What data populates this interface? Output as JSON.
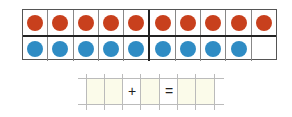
{
  "ten_frame": {
    "columns": 10,
    "top_row": {
      "count": 10,
      "color": "#c8401d"
    },
    "bottom_row": {
      "count": 9,
      "color": "#2f8cc4"
    }
  },
  "equation": {
    "cells": [
      "",
      "",
      "+",
      "",
      "=",
      "",
      ""
    ],
    "plus": "+",
    "equals": "="
  }
}
